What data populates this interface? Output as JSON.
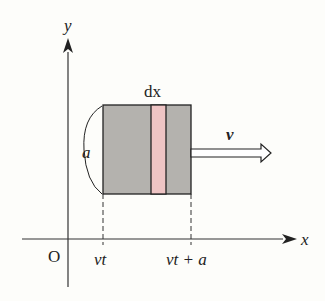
{
  "diagram": {
    "axes": {
      "x_label": "x",
      "y_label": "y",
      "origin_label": "O"
    },
    "block": {
      "side_label": "a",
      "strip_label": "dx",
      "velocity_label": "v"
    },
    "ticks": {
      "left": "vt",
      "right": "vt + a"
    },
    "colors": {
      "block_fill": "#b4b2ae",
      "strip_fill": "#eec4c4",
      "line": "#222222",
      "background": "#fdfdfa"
    }
  }
}
